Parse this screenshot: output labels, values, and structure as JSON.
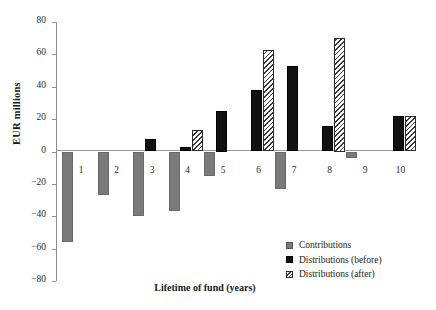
{
  "chart_data": {
    "type": "bar",
    "title": "",
    "xlabel": "Lifetime of fund (years)",
    "ylabel": "EUR millions",
    "categories": [
      "1",
      "2",
      "3",
      "4",
      "5",
      "6",
      "7",
      "8",
      "9",
      "10"
    ],
    "ylim": [
      -80,
      80
    ],
    "yticks": [
      80,
      60,
      40,
      20,
      0,
      -20,
      -40,
      -60,
      -80
    ],
    "ytick_labels": [
      "80",
      "60",
      "40",
      "20",
      "0",
      "−20",
      "−40",
      "−60",
      "−80"
    ],
    "grid": false,
    "legend_position": "bottom-right",
    "series": [
      {
        "name": "Contributions",
        "color": "#7a7a7a",
        "pattern": "solid-gray",
        "values": [
          -56,
          -27,
          -40,
          -37,
          -15,
          0,
          -23,
          0,
          -4,
          0
        ]
      },
      {
        "name": "Distributions (before)",
        "color": "#111111",
        "pattern": "solid-black",
        "values": [
          0,
          0,
          8,
          3,
          25,
          38,
          53,
          16,
          0,
          22
        ]
      },
      {
        "name": "Distributions (after)",
        "color": "#ffffff",
        "pattern": "diagonal-hatch",
        "values": [
          0,
          0,
          0,
          13,
          0,
          63,
          0,
          70,
          0,
          22
        ]
      }
    ]
  },
  "legend": {
    "items": [
      {
        "label": "Contributions",
        "swatch": "contrib"
      },
      {
        "label": "Distributions (before)",
        "swatch": "before"
      },
      {
        "label": "Distributions (after)",
        "swatch": "after"
      }
    ]
  }
}
